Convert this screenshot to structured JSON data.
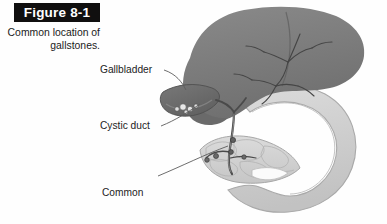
{
  "figure": {
    "banner_label": "Figure 8-1",
    "caption": "Common location of\ngallstones.",
    "caption_line1": "Common location of",
    "caption_line2": "gallstones."
  },
  "labels": [
    {
      "id": "gallbladder",
      "text": "Gallbladder",
      "x": 100,
      "y": 64
    },
    {
      "id": "cystic-duct",
      "text": "Cystic duct",
      "x": 100,
      "y": 120
    },
    {
      "id": "common-bile-duct",
      "text": "Common\nbile duct",
      "line1": "Common",
      "line2": "bile duct",
      "x": 102,
      "y": 162
    }
  ],
  "anatomy": {
    "liver": {
      "name": "liver",
      "color": "#7c7c7c"
    },
    "liver_lobe": {
      "name": "liver-lobe",
      "color": "#6e6e6e"
    },
    "gallbladder": {
      "name": "gallbladder",
      "color": "#6a6a6a"
    },
    "duodenum": {
      "name": "duodenum",
      "color": "#cfcfcf"
    },
    "pancreas": {
      "name": "pancreas",
      "color": "#d2d2d2"
    },
    "ducts": {
      "name": "bile-ducts",
      "color": "#5a5a5a"
    },
    "gallstones": {
      "name": "gallstones",
      "color": "#efefef"
    }
  },
  "colors": {
    "banner_bg": "#100f0f",
    "banner_text": "#ffffff",
    "label_text": "#232323",
    "leader_line": "#5c5c5c",
    "page_bg": "#ffffff"
  }
}
